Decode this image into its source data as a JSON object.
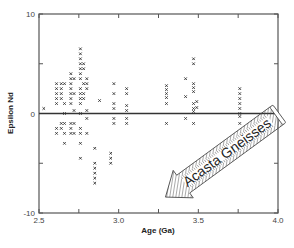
{
  "chart_data": {
    "type": "scatter",
    "title": "",
    "xlabel": "Age (Ga)",
    "ylabel": "Epsilon Nd",
    "xlim": [
      2.5,
      4.0
    ],
    "ylim": [
      -10,
      10
    ],
    "x_ticks": [
      2.5,
      2.75,
      3.0,
      3.25,
      3.5,
      3.75,
      4.0
    ],
    "x_tick_labels": [
      "2.5",
      "3.0",
      "3.5",
      "4.0"
    ],
    "x_tick_label_values": [
      2.5,
      3.0,
      3.5,
      4.0
    ],
    "y_ticks": [
      -10,
      -5,
      0,
      5,
      10
    ],
    "y_tick_labels": [
      "-10",
      "0",
      "10"
    ],
    "y_tick_label_values": [
      -10,
      0,
      10
    ],
    "grid": false,
    "reference_line": {
      "y": 0
    },
    "marker": "x",
    "annotation": {
      "text": "Acasta Gneisses",
      "style": "hatched-arrow",
      "from": [
        4.0,
        0.0
      ],
      "to": [
        3.3,
        -8.2
      ]
    },
    "series": [
      {
        "name": "Epsilon Nd samples",
        "points": [
          [
            2.53,
            0.5
          ],
          [
            2.61,
            3.0
          ],
          [
            2.61,
            2.5
          ],
          [
            2.61,
            2.0
          ],
          [
            2.61,
            1.5
          ],
          [
            2.61,
            1.0
          ],
          [
            2.61,
            -1.5
          ],
          [
            2.61,
            -2.0
          ],
          [
            2.64,
            3.0
          ],
          [
            2.64,
            2.5
          ],
          [
            2.64,
            2.0
          ],
          [
            2.64,
            1.5
          ],
          [
            2.64,
            -1.0
          ],
          [
            2.64,
            -1.5
          ],
          [
            2.66,
            3.0
          ],
          [
            2.66,
            1.0
          ],
          [
            2.66,
            0.0
          ],
          [
            2.66,
            -1.0
          ],
          [
            2.66,
            -2.0
          ],
          [
            2.66,
            -3.0
          ],
          [
            2.7,
            4.0
          ],
          [
            2.7,
            3.5
          ],
          [
            2.7,
            3.0
          ],
          [
            2.7,
            2.5
          ],
          [
            2.7,
            2.0
          ],
          [
            2.7,
            1.5
          ],
          [
            2.7,
            1.0
          ],
          [
            2.7,
            -1.0
          ],
          [
            2.7,
            -1.5
          ],
          [
            2.7,
            -2.0
          ],
          [
            2.72,
            3.5
          ],
          [
            2.72,
            2.0
          ],
          [
            2.72,
            0.3
          ],
          [
            2.72,
            -1.0
          ],
          [
            2.72,
            -2.0
          ],
          [
            2.76,
            6.5
          ],
          [
            2.76,
            6.0
          ],
          [
            2.76,
            5.5
          ],
          [
            2.76,
            5.0
          ],
          [
            2.76,
            4.5
          ],
          [
            2.76,
            4.0
          ],
          [
            2.76,
            3.5
          ],
          [
            2.76,
            2.5
          ],
          [
            2.76,
            2.0
          ],
          [
            2.76,
            1.5
          ],
          [
            2.76,
            1.0
          ],
          [
            2.76,
            0.0
          ],
          [
            2.76,
            -1.5
          ],
          [
            2.76,
            -2.0
          ],
          [
            2.76,
            -3.0
          ],
          [
            2.76,
            -4.5
          ],
          [
            2.78,
            5.0
          ],
          [
            2.78,
            4.5
          ],
          [
            2.78,
            3.0
          ],
          [
            2.78,
            2.0
          ],
          [
            2.78,
            1.5
          ],
          [
            2.8,
            3.5
          ],
          [
            2.8,
            3.0
          ],
          [
            2.8,
            2.5
          ],
          [
            2.8,
            0.3
          ],
          [
            2.8,
            -0.5
          ],
          [
            2.8,
            -2.0
          ],
          [
            2.85,
            -3.5
          ],
          [
            2.85,
            -5.0
          ],
          [
            2.85,
            -5.5
          ],
          [
            2.85,
            -6.0
          ],
          [
            2.85,
            -6.5
          ],
          [
            2.85,
            -7.0
          ],
          [
            2.88,
            1.3
          ],
          [
            2.95,
            -4.0
          ],
          [
            2.95,
            -4.5
          ],
          [
            2.95,
            -5.0
          ],
          [
            2.97,
            3.0
          ],
          [
            2.97,
            2.0
          ],
          [
            2.97,
            1.0
          ],
          [
            2.97,
            0.5
          ],
          [
            2.97,
            -0.5
          ],
          [
            2.97,
            -1.0
          ],
          [
            3.05,
            2.5
          ],
          [
            3.05,
            2.0
          ],
          [
            3.05,
            0.8
          ],
          [
            3.05,
            0.3
          ],
          [
            3.05,
            -0.5
          ],
          [
            3.05,
            -1.0
          ],
          [
            3.3,
            2.8
          ],
          [
            3.3,
            2.4
          ],
          [
            3.3,
            2.0
          ],
          [
            3.3,
            1.6
          ],
          [
            3.3,
            1.0
          ],
          [
            3.3,
            -1.0
          ],
          [
            3.42,
            3.5
          ],
          [
            3.42,
            1.7
          ],
          [
            3.42,
            -0.5
          ],
          [
            3.47,
            5.5
          ],
          [
            3.47,
            5.0
          ],
          [
            3.47,
            3.0
          ],
          [
            3.47,
            2.6
          ],
          [
            3.47,
            2.2
          ],
          [
            3.47,
            1.0
          ],
          [
            3.47,
            0.5
          ],
          [
            3.47,
            0.2
          ],
          [
            3.49,
            1.2
          ],
          [
            3.49,
            0.6
          ],
          [
            3.47,
            -1.0
          ],
          [
            3.76,
            2.5
          ],
          [
            3.76,
            2.0
          ],
          [
            3.76,
            1.5
          ],
          [
            3.76,
            1.0
          ],
          [
            3.76,
            0.5
          ],
          [
            3.76,
            0.0
          ],
          [
            3.76,
            -0.3
          ],
          [
            3.76,
            -1.0
          ]
        ]
      }
    ]
  },
  "colors": {
    "axis": "#555555",
    "marker": "#333333",
    "arrow_fill": "#ffffff",
    "arrow_hatch": "#555555",
    "background": "#ffffff"
  }
}
